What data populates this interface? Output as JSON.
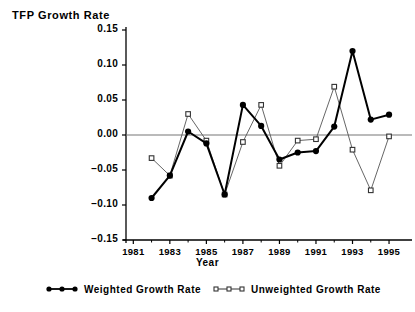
{
  "chart_data": {
    "type": "line",
    "title": "",
    "ylabel": "TFP  Growth  Rate",
    "xlabel": "Year",
    "x": [
      1982,
      1983,
      1984,
      1985,
      1986,
      1987,
      1988,
      1989,
      1990,
      1991,
      1992,
      1993,
      1994,
      1995
    ],
    "xlim": [
      1980.6,
      1995.6
    ],
    "ylim": [
      -0.15,
      0.15
    ],
    "xticks": [
      1981,
      1983,
      1985,
      1987,
      1989,
      1991,
      1993,
      1995
    ],
    "xtick_labels": [
      "1981",
      "1983",
      "1985",
      "1987",
      "1989",
      "1991",
      "1993",
      "1995"
    ],
    "xminorticks": [
      1982,
      1984,
      1986,
      1988,
      1990,
      1992,
      1994
    ],
    "yticks": [
      -0.15,
      -0.1,
      -0.05,
      0.0,
      0.05,
      0.1,
      0.15
    ],
    "ytick_labels": [
      "−0.15",
      "−0.10",
      "−0.05",
      "0.00",
      "0.05",
      "0.10",
      "0.15"
    ],
    "grid": false,
    "zero_line": true,
    "legend_position": "below-axes",
    "series": [
      {
        "name": "Weighted  Growth  Rate",
        "marker": "filled-circle",
        "color": "#000000",
        "line_width": 2.0,
        "values": [
          -0.09,
          -0.058,
          0.005,
          -0.012,
          -0.085,
          0.043,
          0.013,
          -0.035,
          -0.025,
          -0.023,
          0.012,
          0.12,
          0.022,
          0.029
        ]
      },
      {
        "name": "Unweighted  Growth  Rate",
        "marker": "open-square",
        "color": "#555555",
        "line_width": 0.9,
        "values": [
          -0.033,
          -0.058,
          0.03,
          -0.008,
          -0.085,
          -0.01,
          0.043,
          -0.044,
          -0.008,
          -0.006,
          0.069,
          -0.021,
          -0.079,
          -0.002
        ]
      }
    ]
  },
  "legend": {
    "items": [
      {
        "label": "Weighted  Growth  Rate",
        "marker": "filled-circle"
      },
      {
        "label": "Unweighted  Growth  Rate",
        "marker": "open-square"
      }
    ]
  }
}
